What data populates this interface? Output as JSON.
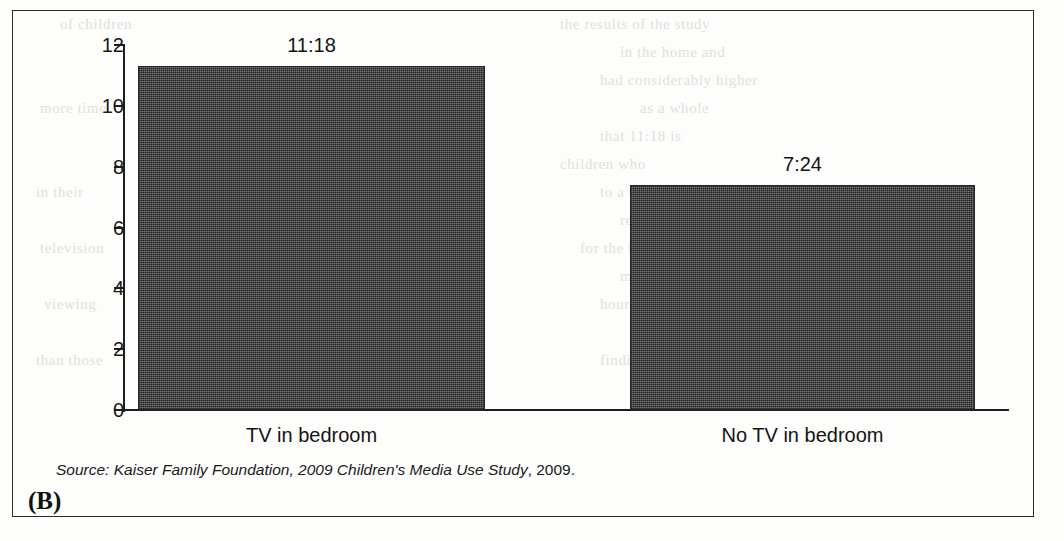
{
  "figure": {
    "panel_letter": "(B)",
    "source_prefix": "Source: Kaiser Family Foundation, 2009 Children's Media Use Study",
    "source_suffix": ", 2009."
  },
  "chart_data": {
    "type": "bar",
    "title": "",
    "xlabel": "",
    "ylabel": "",
    "categories": [
      "TV in bedroom",
      "No TV in bedroom"
    ],
    "values": [
      11.3,
      7.4
    ],
    "data_labels": [
      "11:18",
      "7:24"
    ],
    "ylim": [
      0,
      12
    ],
    "yticks": [
      0,
      2,
      4,
      6,
      8,
      10,
      12
    ],
    "ytick_labels": [
      "0",
      "2",
      "4",
      "6",
      "8",
      "10",
      "12"
    ],
    "grid": false,
    "legend": false,
    "bar_color": "#4f4f4f",
    "axis_color": "#1d1d1d",
    "note": "Hours:minutes of daily media use"
  },
  "bleed_text": [
    {
      "text": "the results of the study",
      "x": 560,
      "y": 16
    },
    {
      "text": "in the home and",
      "x": 620,
      "y": 44
    },
    {
      "text": "had considerably higher",
      "x": 600,
      "y": 72
    },
    {
      "text": "as a whole",
      "x": 640,
      "y": 100
    },
    {
      "text": "that 11:18 is",
      "x": 600,
      "y": 128
    },
    {
      "text": "children who",
      "x": 560,
      "y": 156
    },
    {
      "text": "to a television",
      "x": 600,
      "y": 184
    },
    {
      "text": "research on",
      "x": 620,
      "y": 212
    },
    {
      "text": "for the longer",
      "x": 580,
      "y": 240
    },
    {
      "text": "media use",
      "x": 620,
      "y": 268
    },
    {
      "text": "hours among",
      "x": 600,
      "y": 296
    },
    {
      "text": "the same",
      "x": 640,
      "y": 324
    },
    {
      "text": "findings",
      "x": 600,
      "y": 352
    },
    {
      "text": "of children",
      "x": 60,
      "y": 16
    },
    {
      "text": "more time",
      "x": 40,
      "y": 100
    },
    {
      "text": "in their",
      "x": 36,
      "y": 184
    },
    {
      "text": "television",
      "x": 40,
      "y": 240
    },
    {
      "text": "viewing",
      "x": 44,
      "y": 296
    },
    {
      "text": "than those",
      "x": 36,
      "y": 352
    }
  ]
}
